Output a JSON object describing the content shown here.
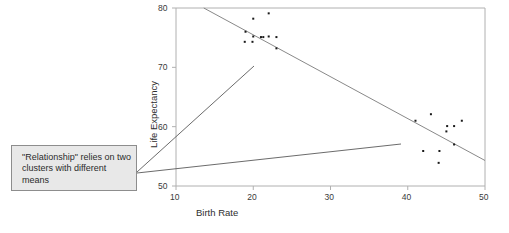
{
  "figure": {
    "name": "birth-rate-life-expectancy-scatter",
    "background_color": "#ffffff"
  },
  "annotation": {
    "text": "\"Relationship\" relies on two clusters with different means",
    "box_fill": "#e8e8e8",
    "box_border": "#8d8d8d",
    "text_color": "#2b2b2b",
    "leader_line_color": "#5a5a5a"
  },
  "chart_data": {
    "type": "scatter",
    "title": "",
    "xlabel": "Birth Rate",
    "ylabel": "Life Expectancy",
    "xlim": [
      10,
      50
    ],
    "ylim": [
      50,
      80
    ],
    "xticks": [
      10,
      20,
      30,
      40,
      50
    ],
    "yticks": [
      50,
      60,
      70,
      80
    ],
    "xtick_labels": [
      "10",
      "20",
      "30",
      "40",
      "50"
    ],
    "ytick_labels": [
      "50",
      "60",
      "70",
      "80"
    ],
    "grid": false,
    "legend": null,
    "marker_color": "#1a1a1a",
    "marker_size": 2,
    "frame_color": "#b0b0b0",
    "points": [
      {
        "x": 19.0,
        "y": 76.0
      },
      {
        "x": 18.9,
        "y": 74.3
      },
      {
        "x": 20.0,
        "y": 78.2
      },
      {
        "x": 20.0,
        "y": 75.2
      },
      {
        "x": 19.9,
        "y": 74.3
      },
      {
        "x": 21.0,
        "y": 75.1
      },
      {
        "x": 21.3,
        "y": 75.1
      },
      {
        "x": 22.0,
        "y": 79.1
      },
      {
        "x": 22.0,
        "y": 75.2
      },
      {
        "x": 23.0,
        "y": 75.1
      },
      {
        "x": 23.0,
        "y": 73.2
      },
      {
        "x": 41.0,
        "y": 61.0
      },
      {
        "x": 42.0,
        "y": 55.9
      },
      {
        "x": 43.0,
        "y": 62.1
      },
      {
        "x": 44.0,
        "y": 53.9
      },
      {
        "x": 44.1,
        "y": 55.9
      },
      {
        "x": 45.0,
        "y": 59.2
      },
      {
        "x": 45.1,
        "y": 60.1
      },
      {
        "x": 46.0,
        "y": 60.1
      },
      {
        "x": 46.0,
        "y": 57.0
      },
      {
        "x": 47.0,
        "y": 61.0
      }
    ],
    "trend_line": {
      "name": "overall-regression-line",
      "color": "#7a7a7a",
      "x_start": 13.6,
      "y_start": 80.0,
      "x_end": 50.0,
      "y_end": 54.3
    },
    "leader_lines": [
      {
        "name": "upper-leader-line",
        "x_start_px": 137,
        "y_start_px": 172,
        "x_end_px": 254,
        "y_end_px": 66
      },
      {
        "name": "lower-leader-line",
        "x_start_px": 137,
        "y_start_px": 173,
        "x_end_px": 401,
        "y_end_px": 144
      }
    ]
  }
}
